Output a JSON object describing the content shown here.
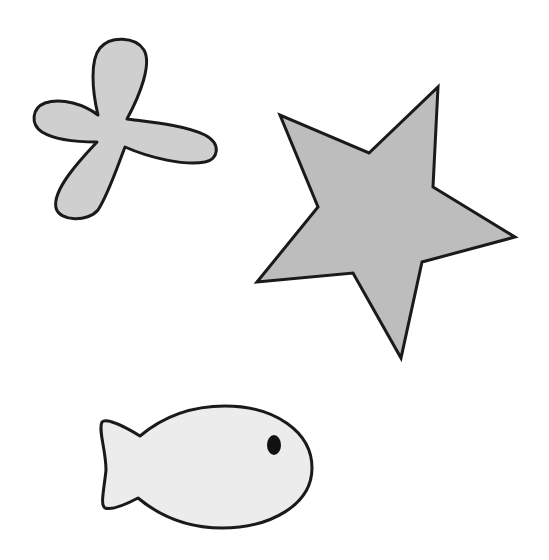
{
  "canvas": {
    "width": 549,
    "height": 560,
    "background": "#ffffff"
  },
  "shapes": [
    {
      "name": "flower",
      "fill": "#cfcfcf",
      "stroke": "#1a1a1a"
    },
    {
      "name": "star",
      "fill": "#bdbdbd",
      "stroke": "#1a1a1a"
    },
    {
      "name": "fish",
      "fill": "#ececec",
      "stroke": "#1a1a1a",
      "eye": "#111111"
    }
  ]
}
